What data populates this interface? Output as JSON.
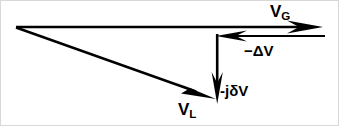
{
  "figure": {
    "kind": "phasor-vector-diagram",
    "width": 339,
    "height": 126,
    "background_color": "#ffffff",
    "stroke_color": "#000000",
    "border_color": "#d8d8d8"
  },
  "vectors": {
    "vg": {
      "label_main": "V",
      "label_sub": "G",
      "label_full": "V_G",
      "direction": "right",
      "start": {
        "x": 16,
        "y": 27
      },
      "end": {
        "x": 322,
        "y": 27
      }
    },
    "delta_v": {
      "label_full": "−ΔV",
      "direction": "left",
      "start": {
        "x": 325,
        "y": 36
      },
      "end": {
        "x": 217,
        "y": 36
      }
    },
    "jdelta_v": {
      "label_full": "-jδV",
      "direction": "down",
      "start": {
        "x": 217,
        "y": 35
      },
      "end": {
        "x": 217,
        "y": 103
      }
    },
    "vl": {
      "label_main": "V",
      "label_sub": "L",
      "label_full": "V_L",
      "direction": "down-right",
      "start": {
        "x": 16,
        "y": 27
      },
      "end": {
        "x": 215,
        "y": 98
      }
    }
  }
}
